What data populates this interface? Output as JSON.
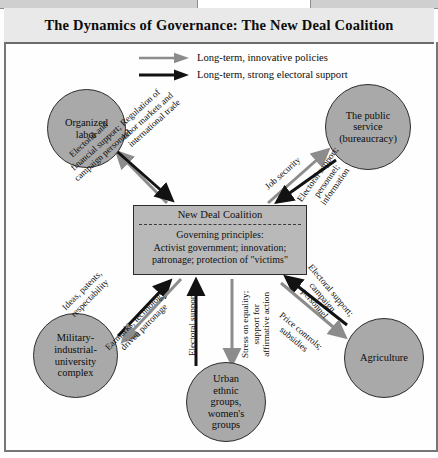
{
  "figure": {
    "title": "The Dynamics of Governance: The New Deal Coalition"
  },
  "legend": {
    "items": [
      {
        "id": "innovative-policies",
        "label": "Long-term, innovative policies",
        "color": "#8c8c8c",
        "style": "gray-arrow"
      },
      {
        "id": "electoral-support",
        "label": "Long-term, strong electoral support",
        "color": "#121212",
        "style": "black-arrow"
      }
    ]
  },
  "center": {
    "heading": "New Deal Coalition",
    "principles_label": "Governing principles:",
    "principles_line1": "Activist government; innovation;",
    "principles_line2": "patronage; protection of \"victims\""
  },
  "nodes": [
    {
      "id": "organized-labor",
      "line1": "Organized",
      "line2": "labor"
    },
    {
      "id": "public-service",
      "line1": "The public",
      "line2": "service",
      "line3": "(bureaucracy)"
    },
    {
      "id": "military-complex",
      "line1": "Military-",
      "line2": "industrial-",
      "line3": "university",
      "line4": "complex"
    },
    {
      "id": "urban-ethnic",
      "line1": "Urban",
      "line2": "ethnic",
      "line3": "groups,",
      "line4": "women's",
      "line5": "groups"
    },
    {
      "id": "agriculture",
      "line1": "Agriculture"
    }
  ],
  "edges": {
    "labor_out": {
      "line1": "Regulation of",
      "line2": "labor markets and",
      "line3": "international trade",
      "kind": "policy"
    },
    "labor_in": {
      "line1": "Electoral and",
      "line2": "financial support;",
      "line3": "campaign personnel",
      "kind": "support"
    },
    "bureaucracy_out": {
      "line1": "Job security",
      "kind": "policy"
    },
    "bureaucracy_in": {
      "line1": "Electoral support;",
      "line2": "personnel;",
      "line3": "information",
      "kind": "support"
    },
    "military_in": {
      "line1": "Ideas, patents,",
      "line2": "respectability",
      "kind": "support"
    },
    "military_out": {
      "line1": "Earmarks; technology-",
      "line2": "driven patronage",
      "kind": "policy"
    },
    "urban_in": {
      "line1": "Electoral support",
      "kind": "support"
    },
    "urban_out": {
      "line1": "Stress on equality;",
      "line2": "support for",
      "line3": "affirmative action",
      "kind": "policy"
    },
    "agriculture_in": {
      "line1": "Electoral support;",
      "line2": "campaign",
      "line3": "personnel",
      "kind": "support"
    },
    "agriculture_out": {
      "line1": "Price controls;",
      "line2": "subsidies",
      "kind": "policy"
    }
  },
  "colors": {
    "policy_arrow": "#8c8c8c",
    "support_arrow": "#121212",
    "node_fill": "#a9a9a9",
    "center_fill": "#b9b9b9",
    "frame": "#777777",
    "title_band": "#e9e9e9"
  }
}
